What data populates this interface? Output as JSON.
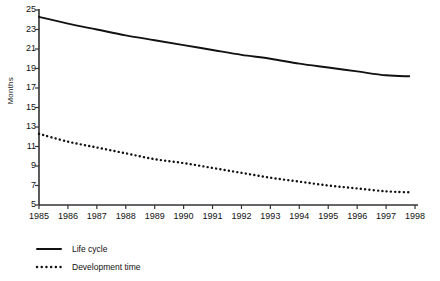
{
  "chart_data": {
    "type": "line",
    "title": "",
    "subtitle": "",
    "xlabel": "",
    "ylabel": "Months",
    "xlim": [
      1985,
      1998
    ],
    "ylim": [
      5,
      25
    ],
    "ytick_step": 2,
    "grid": false,
    "legend_position": "bottom-left",
    "categories": [
      1985,
      1986,
      1987,
      1988,
      1989,
      1990,
      1991,
      1992,
      1993,
      1994,
      1995,
      1996,
      1997,
      1998
    ],
    "xticklabels": [
      "1985",
      "1986",
      "1987",
      "1988",
      "1989",
      "1990",
      "1991",
      "1992",
      "1993",
      "1994",
      "1995",
      "1996",
      "1997",
      "1998"
    ],
    "yticklabels": [
      "25",
      "23",
      "21",
      "19",
      "17",
      "15",
      "13",
      "11",
      "9",
      "7",
      "5"
    ],
    "yticks": [
      25,
      23,
      21,
      19,
      17,
      15,
      13,
      11,
      9,
      7,
      5
    ],
    "series": [
      {
        "name": "Life cycle",
        "style": "solid",
        "color": "#111111",
        "x": [
          1985,
          1986,
          1987,
          1988,
          1989,
          1990,
          1991,
          1992,
          1993,
          1994,
          1995,
          1996,
          1997,
          1997.8
        ],
        "values": [
          24.3,
          23.6,
          23.0,
          22.4,
          21.9,
          21.4,
          20.9,
          20.4,
          20.0,
          19.5,
          19.1,
          18.7,
          18.3,
          18.2
        ]
      },
      {
        "name": "Development time",
        "style": "dotted",
        "color": "#111111",
        "x": [
          1985,
          1986,
          1987,
          1988,
          1989,
          1990,
          1991,
          1992,
          1993,
          1994,
          1995,
          1996,
          1997,
          1997.8
        ],
        "values": [
          12.3,
          11.5,
          10.9,
          10.3,
          9.7,
          9.3,
          8.8,
          8.3,
          7.8,
          7.4,
          7.0,
          6.7,
          6.4,
          6.3
        ]
      }
    ]
  },
  "legend": {
    "items": [
      {
        "label": "Life cycle",
        "style": "solid"
      },
      {
        "label": "Development time",
        "style": "dotted"
      }
    ]
  },
  "axis": {
    "y_title": "Months"
  }
}
